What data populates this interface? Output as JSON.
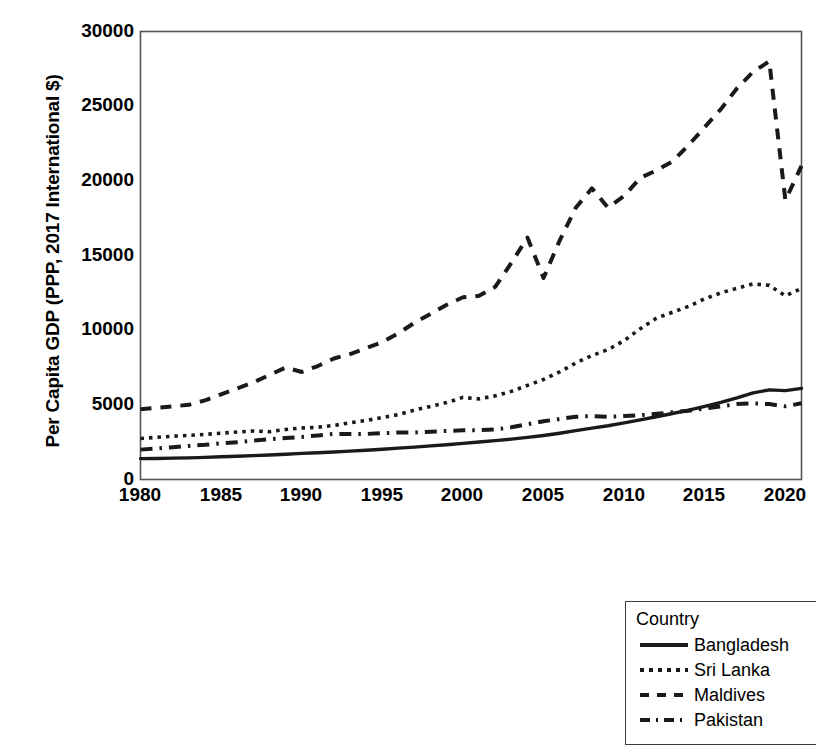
{
  "chart_data": {
    "type": "line",
    "title": "",
    "xlabel": "",
    "ylabel": "Per Capita GDP (PPP, 2017 International $)",
    "xlim": [
      1980,
      2021
    ],
    "ylim": [
      0,
      30000
    ],
    "xticks": [
      1980,
      1985,
      1990,
      1995,
      2000,
      2005,
      2010,
      2015,
      2020
    ],
    "yticks": [
      0,
      5000,
      10000,
      15000,
      20000,
      25000,
      30000
    ],
    "grid": false,
    "legend_position": "bottom-right",
    "legend_title": "Country",
    "x": [
      1980,
      1981,
      1982,
      1983,
      1984,
      1985,
      1986,
      1987,
      1988,
      1989,
      1990,
      1991,
      1992,
      1993,
      1994,
      1995,
      1996,
      1997,
      1998,
      1999,
      2000,
      2001,
      2002,
      2003,
      2004,
      2005,
      2006,
      2007,
      2008,
      2009,
      2010,
      2011,
      2012,
      2013,
      2014,
      2015,
      2016,
      2017,
      2018,
      2019,
      2020,
      2021
    ],
    "series": [
      {
        "name": "Bangladesh",
        "style": "solid",
        "values": [
          1400,
          1410,
          1430,
          1450,
          1480,
          1520,
          1560,
          1600,
          1640,
          1690,
          1750,
          1790,
          1840,
          1900,
          1960,
          2030,
          2100,
          2170,
          2250,
          2330,
          2420,
          2510,
          2600,
          2700,
          2820,
          2950,
          3100,
          3270,
          3440,
          3600,
          3790,
          3990,
          4200,
          4420,
          4650,
          4900,
          5170,
          5470,
          5800,
          6000,
          5950,
          6100
        ],
        "values_px_note": "read from pixel trace; ends ~5100 at plot scale"
      },
      {
        "name": "Sri Lanka",
        "style": "dotted",
        "values": [
          2750,
          2820,
          2900,
          2950,
          3020,
          3100,
          3180,
          3250,
          3200,
          3350,
          3450,
          3500,
          3620,
          3800,
          3950,
          4150,
          4350,
          4650,
          4900,
          5150,
          5500,
          5400,
          5600,
          5900,
          6300,
          6700,
          7200,
          7800,
          8300,
          8700,
          9300,
          10100,
          10800,
          11200,
          11600,
          12100,
          12500,
          12800,
          13100,
          13000,
          12300,
          12800
        ]
      },
      {
        "name": "Maldives",
        "style": "dashed",
        "values": [
          4700,
          4800,
          4900,
          5000,
          5300,
          5700,
          6100,
          6500,
          7000,
          7500,
          7200,
          7600,
          8100,
          8400,
          8800,
          9200,
          9800,
          10500,
          11100,
          11700,
          12200,
          12300,
          12900,
          14500,
          16200,
          13500,
          16000,
          18200,
          19500,
          18200,
          19000,
          20200,
          20700,
          21300,
          22400,
          23600,
          24800,
          26200,
          27300,
          28000,
          18700,
          21000
        ]
      },
      {
        "name": "Pakistan",
        "style": "dashdot",
        "values": [
          2000,
          2080,
          2160,
          2250,
          2320,
          2420,
          2500,
          2600,
          2700,
          2780,
          2850,
          2950,
          3050,
          3050,
          3050,
          3100,
          3150,
          3150,
          3200,
          3250,
          3300,
          3300,
          3350,
          3500,
          3700,
          3900,
          4050,
          4200,
          4250,
          4200,
          4250,
          4300,
          4400,
          4500,
          4600,
          4750,
          4900,
          5050,
          5100,
          5050,
          4900,
          5100
        ]
      }
    ]
  },
  "axes": {
    "ylabel": "Per Capita GDP (PPP, 2017 International $)",
    "ytick_labels": [
      "30000",
      "25000",
      "20000",
      "15000",
      "10000",
      "5000",
      "0"
    ],
    "xtick_labels": [
      "1980",
      "1985",
      "1990",
      "1995",
      "2000",
      "2005",
      "2010",
      "2015",
      "2020"
    ]
  },
  "legend": {
    "title": "Country",
    "entries": [
      {
        "label": "Bangladesh",
        "style": "solid"
      },
      {
        "label": "Sri Lanka",
        "style": "dotted"
      },
      {
        "label": "Maldives",
        "style": "dashed"
      },
      {
        "label": "Pakistan",
        "style": "dashdot"
      }
    ]
  },
  "colors": {
    "line": "#1a1a1a",
    "axis": "#555555",
    "background": "#ffffff"
  }
}
